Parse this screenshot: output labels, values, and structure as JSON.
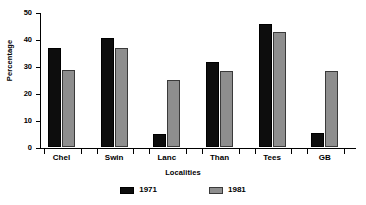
{
  "chart_data": {
    "type": "bar",
    "title": "",
    "xlabel": "Localities",
    "ylabel": "Percentage",
    "categories": [
      "Chel",
      "Swin",
      "Lanc",
      "Than",
      "Tees",
      "GB"
    ],
    "series": [
      {
        "name": "1971",
        "color": "#0d0d0d",
        "values": [
          36.8,
          40.5,
          5.0,
          31.5,
          45.5,
          5.2
        ]
      },
      {
        "name": "1981",
        "color": "#8e8e8e",
        "values": [
          28.6,
          36.5,
          24.7,
          28.2,
          42.5,
          28.0
        ]
      }
    ],
    "ylim": [
      0,
      50
    ],
    "yticks": [
      0,
      10,
      20,
      30,
      40,
      50
    ],
    "ytick_labels": [
      "0",
      "10",
      "20",
      "30",
      "40",
      "50"
    ],
    "grid": false,
    "legend_position": "bottom"
  },
  "legend": {
    "items": [
      {
        "label": "1971"
      },
      {
        "label": "1981"
      }
    ]
  }
}
